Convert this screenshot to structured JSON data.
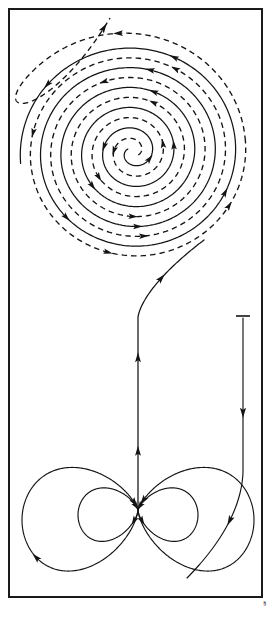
{
  "figure": {
    "background_color": "#ffffff",
    "line_color": "#141414",
    "frame": {
      "label": "border-frame",
      "x": 9,
      "y": 9,
      "width": 253,
      "height": 588,
      "stroke_width": 2
    },
    "corner_mark": {
      "label": "corner-glyph",
      "text": "§",
      "x": 263,
      "y": 600
    },
    "scale_bar": {
      "label": "top-tick-mark",
      "x": 243,
      "y": 316,
      "half_width": 7
    },
    "annotations": {
      "spiral_center_x": 133,
      "spiral_center_y": 152,
      "null_point_x": 138,
      "null_point_y": 510,
      "trunk_top_y": 318,
      "right_line_x": 243
    }
  },
  "chart_data": {
    "type": "line",
    "subtitle": "Double spiral flux rope connected to dipolar footpoint region",
    "xlabel": "",
    "ylabel": "",
    "xlim": [
      0,
      274
    ],
    "ylim": [
      0,
      620
    ],
    "grid": false,
    "legend": "none",
    "series": [
      {
        "name": "solid-spiral",
        "style": "solid",
        "type": "archimedean-spiral",
        "center": [
          133,
          152
        ],
        "turns": 5.1,
        "start_radius": 6,
        "end_radius": 113,
        "phase_deg": 150,
        "direction": "counterclockwise-inward",
        "arrow_count": 11
      },
      {
        "name": "dashed-spiral",
        "style": "dashed",
        "type": "archimedean-spiral",
        "center": [
          133,
          152
        ],
        "turns": 5.1,
        "start_radius": 6,
        "end_radius": 113,
        "phase_deg": 330,
        "direction": "counterclockwise-inward",
        "arrow_count": 11
      },
      {
        "name": "dashed-outflow-tail",
        "style": "dashed",
        "type": "open-curve",
        "ends_at": [
          110,
          18
        ],
        "arrow_count": 2
      },
      {
        "name": "solid-trunk",
        "style": "solid",
        "type": "open-curve",
        "from": [
          138,
          510
        ],
        "to": [
          196,
          252
        ],
        "arrow_count": 3
      },
      {
        "name": "outer-left-lobe",
        "style": "solid",
        "type": "closed-loop",
        "center": [
          80,
          520
        ],
        "radius": 58,
        "arrow_count": 2
      },
      {
        "name": "inner-left-lobe",
        "style": "solid",
        "type": "closed-loop",
        "center": [
          108,
          515
        ],
        "radius": 30,
        "arrow_count": 2
      },
      {
        "name": "inner-right-lobe",
        "style": "solid",
        "type": "closed-loop",
        "center": [
          168,
          515
        ],
        "radius": 30,
        "arrow_count": 2
      },
      {
        "name": "outer-right-lobe",
        "style": "solid",
        "type": "closed-loop",
        "center": [
          196,
          520
        ],
        "radius": 58,
        "arrow_count": 2
      },
      {
        "name": "right-descending-line",
        "style": "solid",
        "type": "open-curve",
        "from": [
          243,
          318
        ],
        "to": [
          190,
          568
        ],
        "arrow_count": 2
      }
    ]
  }
}
